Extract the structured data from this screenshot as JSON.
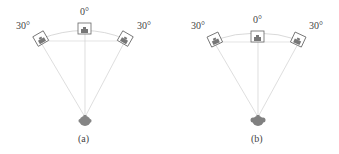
{
  "panels": [
    {
      "caption": "(a)",
      "center_label": "0°",
      "left_label": "30°",
      "right_label": "30°"
    },
    {
      "caption": "(b)",
      "center_label": "0°",
      "left_label": "30°",
      "right_label": "30°"
    }
  ],
  "colors": {
    "line": "#c8c8c8",
    "speaker_box": "#666666",
    "speaker_fill": "#777777",
    "head": "#808080"
  }
}
